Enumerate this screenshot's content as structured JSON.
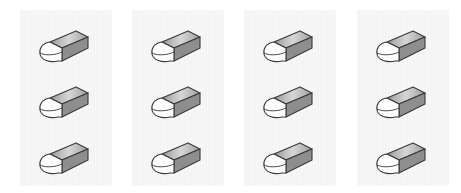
{
  "layout": {
    "columns": 4,
    "rows": 3,
    "panel_left_positions": [
      20,
      132,
      244,
      357
    ]
  },
  "icon": {
    "name": "eraser-icon",
    "colors": {
      "outline": "#3a3a3a",
      "front": "#ffffff",
      "top_light": "#d8d8d8",
      "top_dark": "#9a9a9a",
      "side": "#8c8c8c"
    }
  },
  "panels": [
    {
      "id": "column-1",
      "items": [
        "eraser",
        "eraser",
        "eraser"
      ]
    },
    {
      "id": "column-2",
      "items": [
        "eraser",
        "eraser",
        "eraser"
      ]
    },
    {
      "id": "column-3",
      "items": [
        "eraser",
        "eraser",
        "eraser"
      ]
    },
    {
      "id": "column-4",
      "items": [
        "eraser",
        "eraser",
        "eraser"
      ]
    }
  ]
}
